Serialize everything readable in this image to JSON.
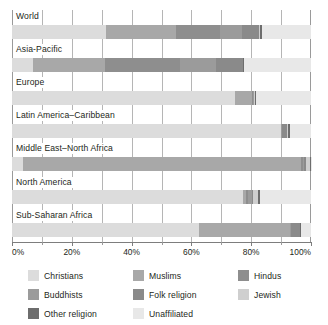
{
  "chart_data": {
    "type": "bar",
    "orientation": "horizontal",
    "stacked": true,
    "title": "",
    "xlabel": "",
    "ylabel": "",
    "xlim": [
      0,
      100
    ],
    "xticks": [
      0,
      20,
      40,
      60,
      80,
      100
    ],
    "xtick_labels": [
      "0%",
      "20%",
      "40%",
      "60%",
      "80%",
      "100%"
    ],
    "grid": true,
    "legend_position": "bottom",
    "categories": [
      "World",
      "Asia-Pacific",
      "Europe",
      "Latin America–Caribbean",
      "Middle East–North Africa",
      "North America",
      "Sub-Saharan Africa"
    ],
    "series": [
      {
        "name": "Christians",
        "color": "#dcdcdc",
        "values": [
          31.5,
          7.0,
          74.5,
          90.0,
          3.7,
          77.4,
          62.7
        ]
      },
      {
        "name": "Muslims",
        "color": "#a8a8a8",
        "values": [
          23.2,
          24.0,
          5.9,
          0.1,
          93.0,
          1.0,
          30.2
        ]
      },
      {
        "name": "Hindus",
        "color": "#8e8e8e",
        "values": [
          15.0,
          25.3,
          0.2,
          0.1,
          0.6,
          0.7,
          0.2
        ]
      },
      {
        "name": "Buddhists",
        "color": "#9b9b9b",
        "values": [
          7.1,
          11.9,
          0.2,
          0.1,
          0.3,
          1.1,
          0.1
        ]
      },
      {
        "name": "Folk religion",
        "color": "#8a8a8a",
        "values": [
          5.9,
          9.0,
          0.2,
          1.7,
          0.6,
          0.4,
          3.1
        ]
      },
      {
        "name": "Jewish",
        "color": "#cfcfcf",
        "values": [
          0.2,
          0.1,
          0.2,
          0.3,
          1.5,
          1.8,
          0.1
        ]
      },
      {
        "name": "Other religion",
        "color": "#6d6d6d",
        "values": [
          0.8,
          0.4,
          0.4,
          0.8,
          0.2,
          0.6,
          0.2
        ]
      },
      {
        "name": "Unaffiliated",
        "color": "#e8e8e8",
        "values": [
          16.3,
          22.3,
          18.4,
          7.0,
          0.1,
          17.0,
          3.4
        ]
      }
    ]
  },
  "axis": {
    "tick_labels": [
      "0%",
      "20%",
      "40%",
      "60%",
      "80%",
      "100%"
    ]
  },
  "legend": {
    "items": [
      {
        "label": "Christians",
        "color": "#dcdcdc"
      },
      {
        "label": "Muslims",
        "color": "#a8a8a8"
      },
      {
        "label": "Hindus",
        "color": "#8e8e8e"
      },
      {
        "label": "Buddhists",
        "color": "#9b9b9b"
      },
      {
        "label": "Folk religion",
        "color": "#8a8a8a"
      },
      {
        "label": "Jewish",
        "color": "#cfcfcf"
      },
      {
        "label": "Other religion",
        "color": "#6d6d6d"
      },
      {
        "label": "Unaffiliated",
        "color": "#e8e8e8"
      }
    ]
  }
}
